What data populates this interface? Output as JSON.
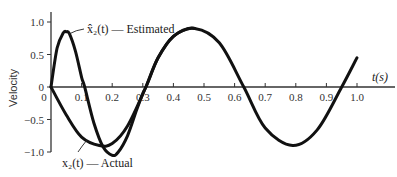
{
  "chart_data": {
    "type": "line",
    "title": "",
    "xlabel": "t(s)",
    "ylabel": "Velocity",
    "xlim": [
      0,
      1.0
    ],
    "ylim": [
      -1.0,
      1.0
    ],
    "grid": false,
    "legend": "inline annotations",
    "x_ticks": [
      "0",
      "0.1",
      "0.2",
      "0.3",
      "0.4",
      "0.5",
      "0.6",
      "0.7",
      "0.8",
      "0.9",
      "1.0"
    ],
    "y_ticks": [
      "1.0",
      "0.5",
      "0",
      "-0.5",
      "-1.0"
    ],
    "series": [
      {
        "name": "x̂₂(t) — Estimated",
        "x": [
          0,
          0.02,
          0.04,
          0.05,
          0.06,
          0.08,
          0.1,
          0.11,
          0.14,
          0.17,
          0.2,
          0.22,
          0.25,
          0.28,
          0.3,
          0.31,
          0.35,
          0.4,
          0.45,
          0.47
        ],
        "values": [
          0,
          0.6,
          0.83,
          0.85,
          0.82,
          0.55,
          0.15,
          0,
          -0.55,
          -0.92,
          -1.05,
          -1.0,
          -0.75,
          -0.35,
          -0.1,
          0,
          0.45,
          0.78,
          0.9,
          0.9
        ]
      },
      {
        "name": "x₂(t) — Actual",
        "x": [
          0,
          0.05,
          0.1,
          0.158,
          0.2,
          0.25,
          0.31,
          0.35,
          0.4,
          0.47,
          0.55,
          0.63,
          0.7,
          0.79,
          0.87,
          0.95,
          1.0
        ],
        "values": [
          0,
          -0.43,
          -0.77,
          -0.9,
          -0.87,
          -0.6,
          0,
          0.45,
          0.78,
          0.9,
          0.68,
          0,
          -0.63,
          -0.9,
          -0.66,
          0,
          0.45
        ]
      }
    ],
    "annotations": [
      {
        "text": "x̂₂(t) — Estimated",
        "points_to": [
          0.06,
          0.8
        ]
      },
      {
        "text": "x₂(t) — Actual",
        "points_to": [
          0.11,
          -0.75
        ]
      }
    ]
  },
  "labels": {
    "xlabel": "t(s)",
    "ylabel": "Velocity",
    "estimated": "x̂₂(t) — Estimated",
    "actual": "x₂(t) — Actual",
    "origin_x": "0"
  }
}
